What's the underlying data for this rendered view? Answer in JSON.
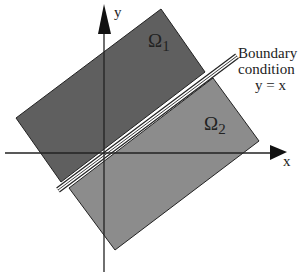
{
  "diagram": {
    "axes": {
      "x_label": "x",
      "y_label": "y"
    },
    "regions": [
      {
        "id": "omega1",
        "symbol": "Ω",
        "subscript": "1",
        "color": "#5f5f5f"
      },
      {
        "id": "omega2",
        "symbol": "Ω",
        "subscript": "2",
        "color": "#8c8c8c"
      }
    ],
    "boundary": {
      "line1": "Boundary",
      "line2": "condition",
      "equation": "y = x"
    },
    "colors": {
      "stroke": "#222222",
      "background": "#ffffff",
      "gap": "#ffffff"
    }
  }
}
